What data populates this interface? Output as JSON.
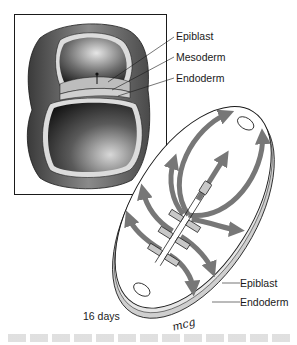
{
  "figure": {
    "inset_labels": [
      {
        "id": "epiblast",
        "text": "Epiblast"
      },
      {
        "id": "mesoderm",
        "text": "Mesoderm"
      },
      {
        "id": "endoderm",
        "text": "Endoderm"
      }
    ],
    "disc_labels": [
      {
        "id": "epiblast",
        "text": "Epiblast"
      },
      {
        "id": "endoderm",
        "text": "Endoderm"
      }
    ],
    "stage_label": "16 days",
    "signature": "mcg",
    "colors": {
      "outline": "#1a1a1a",
      "arrow_gray": "#777777",
      "layer_light": "#d9d9d9",
      "shell_dark": "#555555"
    }
  }
}
